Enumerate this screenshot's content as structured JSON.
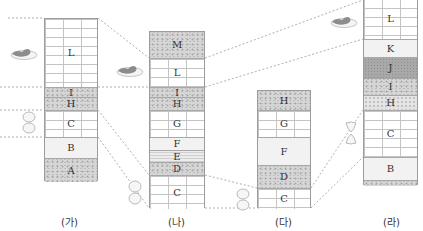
{
  "columns": [
    {
      "label": "(가)",
      "layers": [
        {
          "name": "L",
          "type": "limestone"
        },
        {
          "name": "I",
          "type": "conglomerate"
        },
        {
          "name": "H",
          "type": "conglomerate"
        },
        {
          "name": "C",
          "type": "limestone"
        },
        {
          "name": "B",
          "type": "plain"
        },
        {
          "name": "A",
          "type": "conglomerate"
        }
      ],
      "fossils": [
        "trilobite-near-L",
        "ammonite-near-C"
      ]
    },
    {
      "label": "(나)",
      "layers": [
        {
          "name": "M",
          "type": "conglomerate"
        },
        {
          "name": "L",
          "type": "limestone"
        },
        {
          "name": "I",
          "type": "conglomerate"
        },
        {
          "name": "H",
          "type": "conglomerate"
        },
        {
          "name": "G",
          "type": "limestone"
        },
        {
          "name": "F",
          "type": "plain"
        },
        {
          "name": "E",
          "type": "shale"
        },
        {
          "name": "D",
          "type": "conglomerate"
        },
        {
          "name": "C",
          "type": "limestone"
        }
      ],
      "fossils": [
        "trilobite-near-L",
        "ammonite-near-C"
      ]
    },
    {
      "label": "(다)",
      "layers": [
        {
          "name": "H",
          "type": "conglomerate"
        },
        {
          "name": "G",
          "type": "limestone"
        },
        {
          "name": "F",
          "type": "plain"
        },
        {
          "name": "D",
          "type": "conglomerate"
        },
        {
          "name": "C",
          "type": "limestone"
        }
      ],
      "fossils": [
        "ammonite-near-C"
      ]
    },
    {
      "label": "(라)",
      "layers": [
        {
          "name": "L",
          "type": "limestone"
        },
        {
          "name": "K",
          "type": "plain"
        },
        {
          "name": "J",
          "type": "dark"
        },
        {
          "name": "I",
          "type": "conglomerate"
        },
        {
          "name": "H",
          "type": "sand"
        },
        {
          "name": "C",
          "type": "limestone"
        },
        {
          "name": "B",
          "type": "plain"
        },
        {
          "name": "",
          "type": "conglomerate"
        }
      ],
      "fossils": [
        "trilobite-near-L",
        "ammonite-near-C"
      ]
    }
  ],
  "labels": {
    "ga": "(가)",
    "na": "(나)",
    "da": "(다)",
    "ra": "(라)"
  },
  "layer_text": {
    "ga": [
      "L",
      "I",
      "H",
      "C",
      "B",
      "A"
    ],
    "na": [
      "M",
      "L",
      "I",
      "H",
      "G",
      "F",
      "E",
      "D",
      "C"
    ],
    "da": [
      "H",
      "G",
      "F",
      "D",
      "C"
    ],
    "ra": [
      "L",
      "K",
      "J",
      "I",
      "H",
      "C",
      "B",
      ""
    ]
  }
}
